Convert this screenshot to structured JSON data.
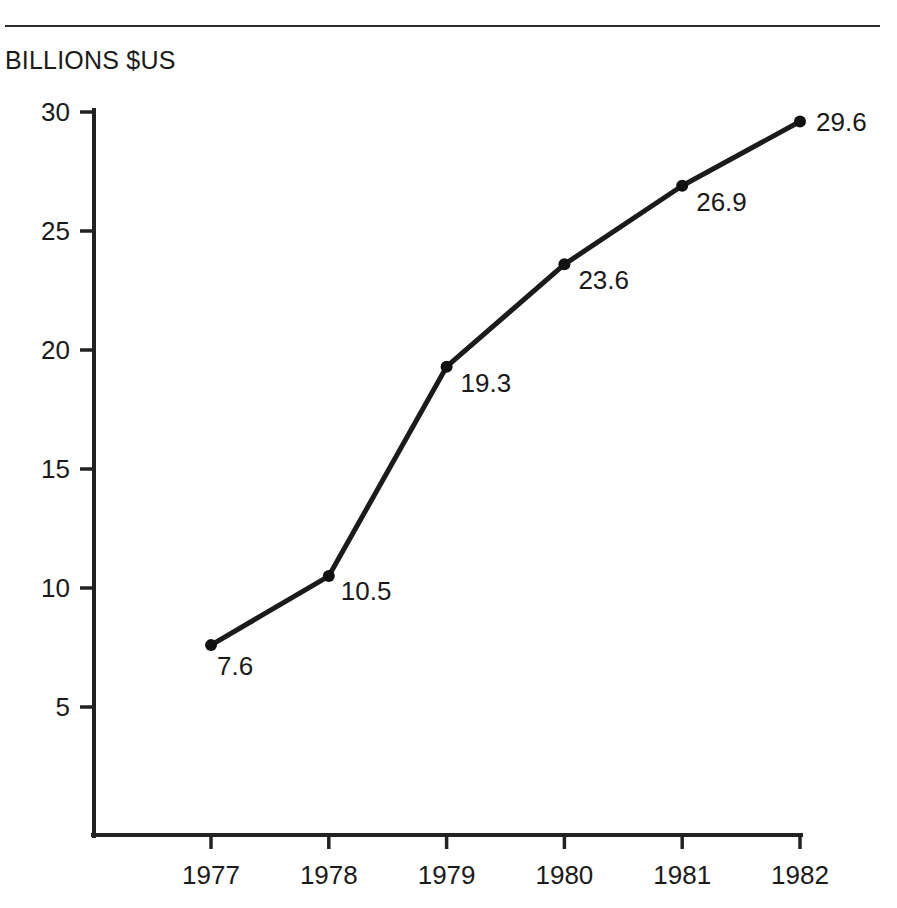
{
  "page": {
    "background_color": "#ffffff",
    "ink_color": "#1a1a1a",
    "top_rule": true
  },
  "header": {
    "unit_label": "BILLIONS $US"
  },
  "chart_data": {
    "type": "line",
    "title": "",
    "subtitle": "",
    "xlabel": "",
    "ylabel": "BILLIONS $US",
    "categories": [
      "1977",
      "1978",
      "1979",
      "1980",
      "1981",
      "1982"
    ],
    "x": [
      1977,
      1978,
      1979,
      1980,
      1981,
      1982
    ],
    "values": [
      7.6,
      10.5,
      19.3,
      23.6,
      26.9,
      29.6
    ],
    "point_labels": [
      "7.6",
      "10.5",
      "19.3",
      "23.6",
      "26.9",
      "29.6"
    ],
    "series": [
      {
        "name": "",
        "values": [
          7.6,
          10.5,
          19.3,
          23.6,
          26.9,
          29.6
        ],
        "color": "#1b1b1b",
        "marker": "circle"
      }
    ],
    "ylim": [
      0,
      31.5
    ],
    "yticks": [
      5,
      10,
      15,
      20,
      25,
      30
    ],
    "ytick_labels": [
      "5",
      "10",
      "15",
      "20",
      "25",
      "30"
    ],
    "xticks": [
      "1977",
      "1978",
      "1979",
      "1980",
      "1981",
      "1982"
    ],
    "grid": false,
    "legend": false,
    "legend_position": "none",
    "line_color": "#1b1b1b",
    "axis_color": "#222222"
  },
  "label_offsets": [
    {
      "dx": 6,
      "dy": 30
    },
    {
      "dx": 12,
      "dy": 24
    },
    {
      "dx": 14,
      "dy": 25
    },
    {
      "dx": 14,
      "dy": 25
    },
    {
      "dx": 14,
      "dy": 25
    },
    {
      "dx": 16,
      "dy": 9
    }
  ]
}
